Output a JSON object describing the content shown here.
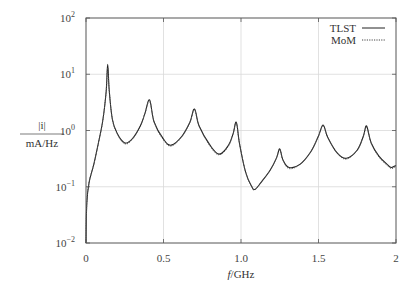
{
  "chart_data": {
    "type": "line",
    "title": "",
    "xlabel": "f/GHz",
    "ylabel": "|i| / mA/Hz",
    "ylabel_numerator": "|i|",
    "ylabel_denominator": "mA/Hz",
    "xlim": [
      0,
      2
    ],
    "ylim": [
      0.01,
      100
    ],
    "yscale": "log",
    "grid": true,
    "legend_position": "upper right",
    "x_ticks": [
      {
        "value": 0,
        "label": "0"
      },
      {
        "value": 0.5,
        "label": "0.5"
      },
      {
        "value": 1.0,
        "label": "1.0"
      },
      {
        "value": 1.5,
        "label": "1.5"
      },
      {
        "value": 2,
        "label": "2"
      }
    ],
    "y_ticks": [
      {
        "value": 0.01,
        "base": "10",
        "exp": "−2"
      },
      {
        "value": 0.1,
        "base": "10",
        "exp": "−1"
      },
      {
        "value": 1,
        "base": "10",
        "exp": "0"
      },
      {
        "value": 10,
        "base": "10",
        "exp": "1"
      },
      {
        "value": 100,
        "base": "10",
        "exp": "2"
      }
    ],
    "series": [
      {
        "name": "TLST",
        "style": "solid",
        "color": "#222222",
        "x": [
          0.0,
          0.005,
          0.02,
          0.05,
          0.08,
          0.11,
          0.13,
          0.14,
          0.15,
          0.17,
          0.2,
          0.25,
          0.3,
          0.35,
          0.38,
          0.41,
          0.44,
          0.5,
          0.55,
          0.62,
          0.67,
          0.7,
          0.73,
          0.8,
          0.86,
          0.92,
          0.95,
          0.97,
          0.99,
          1.03,
          1.07,
          1.09,
          1.13,
          1.19,
          1.23,
          1.25,
          1.27,
          1.31,
          1.38,
          1.45,
          1.5,
          1.53,
          1.56,
          1.62,
          1.68,
          1.75,
          1.79,
          1.81,
          1.84,
          1.89,
          1.95,
          1.97,
          2.0
        ],
        "values": [
          0.01,
          0.05,
          0.12,
          0.25,
          0.6,
          1.6,
          5.0,
          15.0,
          5.0,
          1.6,
          0.9,
          0.6,
          0.72,
          1.2,
          2.0,
          3.5,
          1.4,
          0.7,
          0.55,
          0.8,
          1.4,
          2.4,
          1.2,
          0.55,
          0.38,
          0.55,
          0.9,
          1.4,
          0.6,
          0.18,
          0.1,
          0.09,
          0.12,
          0.2,
          0.33,
          0.47,
          0.3,
          0.22,
          0.25,
          0.42,
          0.8,
          1.25,
          0.75,
          0.4,
          0.32,
          0.45,
          0.8,
          1.2,
          0.6,
          0.35,
          0.24,
          0.22,
          0.24
        ]
      },
      {
        "name": "MoM",
        "style": "dotted",
        "color": "#555555",
        "x": [
          0.0,
          0.005,
          0.02,
          0.05,
          0.08,
          0.11,
          0.13,
          0.14,
          0.15,
          0.17,
          0.2,
          0.25,
          0.3,
          0.35,
          0.38,
          0.41,
          0.44,
          0.5,
          0.55,
          0.62,
          0.67,
          0.7,
          0.73,
          0.8,
          0.86,
          0.92,
          0.95,
          0.97,
          0.99,
          1.03,
          1.07,
          1.09,
          1.13,
          1.19,
          1.23,
          1.25,
          1.27,
          1.31,
          1.38,
          1.45,
          1.5,
          1.53,
          1.56,
          1.62,
          1.68,
          1.75,
          1.79,
          1.81,
          1.84,
          1.89,
          1.95,
          1.97,
          2.0
        ],
        "values": [
          0.01,
          0.05,
          0.12,
          0.25,
          0.6,
          1.6,
          5.0,
          13.0,
          5.0,
          1.6,
          0.88,
          0.58,
          0.7,
          1.2,
          2.0,
          3.3,
          1.4,
          0.68,
          0.53,
          0.78,
          1.4,
          2.3,
          1.2,
          0.53,
          0.37,
          0.54,
          0.9,
          1.35,
          0.6,
          0.18,
          0.1,
          0.088,
          0.12,
          0.2,
          0.33,
          0.46,
          0.3,
          0.21,
          0.25,
          0.42,
          0.8,
          1.2,
          0.75,
          0.4,
          0.31,
          0.45,
          0.8,
          1.15,
          0.6,
          0.34,
          0.23,
          0.21,
          0.23
        ]
      }
    ]
  },
  "legend": {
    "entries": [
      {
        "label": "TLST",
        "style": "solid"
      },
      {
        "label": "MoM",
        "style": "dotted"
      }
    ]
  },
  "axes": {
    "x_label": "f/GHz",
    "y_label_num": "|i|",
    "y_label_den": "mA/Hz"
  },
  "colors": {
    "frame": "#555555",
    "grid": "#d9d9d9",
    "line": "#222222"
  }
}
